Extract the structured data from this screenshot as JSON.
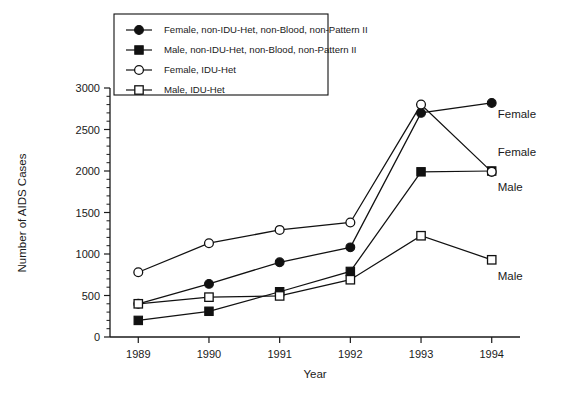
{
  "chart_data": {
    "type": "line",
    "title": "",
    "xlabel": "Year",
    "ylabel": "Number of AIDS Cases",
    "categories": [
      "1989",
      "1990",
      "1991",
      "1992",
      "1993",
      "1994"
    ],
    "x": [
      1989,
      1990,
      1991,
      1992,
      1993,
      1994
    ],
    "xlim": [
      1988.6,
      1994.4
    ],
    "ylim": [
      0,
      3000
    ],
    "ytick_labels": [
      "0",
      "500",
      "1000",
      "1500",
      "2000",
      "2500",
      "3000"
    ],
    "yticks": [
      0,
      500,
      1000,
      1500,
      2000,
      2500,
      3000
    ],
    "yminor_step": 100,
    "grid": false,
    "legend_position": "upper-left-inside",
    "series": [
      {
        "name": "Female, non-IDU-Het, non-Blood, non-Pattern II",
        "marker": "filled-circle",
        "values": [
          400,
          640,
          900,
          1080,
          2700,
          2820
        ]
      },
      {
        "name": "Male, non-IDU-Het, non-Blood, non-Pattern II",
        "marker": "filled-square",
        "values": [
          200,
          310,
          545,
          790,
          1990,
          2000
        ]
      },
      {
        "name": "Female, IDU-Het",
        "marker": "open-circle",
        "values": [
          780,
          1130,
          1290,
          1380,
          2800,
          1990
        ]
      },
      {
        "name": "Male, IDU-Het",
        "marker": "open-square",
        "values": [
          400,
          480,
          495,
          690,
          1220,
          930
        ]
      }
    ],
    "annotations": [
      {
        "text": "Female",
        "x": 1994,
        "y": 2640,
        "series": "Female, non-IDU-Het, non-Blood, non-Pattern II"
      },
      {
        "text": "Female",
        "x": 1994,
        "y": 2180,
        "series": "Female, IDU-Het"
      },
      {
        "text": "Male",
        "x": 1994,
        "y": 1760,
        "series": "Male, non-IDU-Het, non-Blood, non-Pattern II"
      },
      {
        "text": "Male",
        "x": 1994,
        "y": 690,
        "series": "Male, IDU-Het"
      }
    ]
  },
  "legend": {
    "items": [
      {
        "label": "Female, non-IDU-Het, non-Blood, non-Pattern II",
        "marker": "filled-circle"
      },
      {
        "label": "Male, non-IDU-Het, non-Blood, non-Pattern II",
        "marker": "filled-square"
      },
      {
        "label": "Female, IDU-Het",
        "marker": "open-circle"
      },
      {
        "label": "Male, IDU-Het",
        "marker": "open-square"
      }
    ]
  },
  "axes": {
    "x_title": "Year",
    "y_title": "Number of AIDS Cases",
    "x_labels": [
      "1989",
      "1990",
      "1991",
      "1992",
      "1993",
      "1994"
    ],
    "y_labels": [
      "0",
      "500",
      "1000",
      "1500",
      "2000",
      "2500",
      "3000"
    ]
  },
  "annotation_labels": {
    "female_nonidu": "Female",
    "female_idu": "Female",
    "male_nonidu": "Male",
    "male_idu": "Male"
  },
  "colors": {
    "ink": "#111111",
    "background": "#ffffff"
  }
}
